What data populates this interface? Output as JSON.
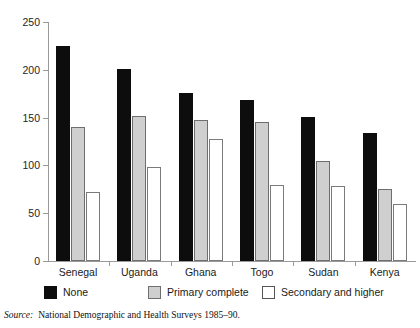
{
  "top_sliver_text": "",
  "chart_data": {
    "type": "bar",
    "title": "",
    "xlabel": "",
    "ylabel": "",
    "ylim": [
      0,
      250
    ],
    "yticks": [
      0,
      50,
      100,
      150,
      200,
      250
    ],
    "ytick_labels": [
      "0",
      "50",
      "100",
      "150",
      "200",
      "250"
    ],
    "grid": false,
    "legend_position": "bottom",
    "categories": [
      "Senegal",
      "Uganda",
      "Ghana",
      "Togo",
      "Sudan",
      "Kenya"
    ],
    "series": [
      {
        "name": "None",
        "color": "#0d0d0d",
        "values": [
          225,
          201,
          176,
          168,
          151,
          134
        ]
      },
      {
        "name": "Primary complete",
        "color": "#cfcfcf",
        "values": [
          140,
          152,
          148,
          145,
          105,
          75
        ]
      },
      {
        "name": "Secondary and higher",
        "color": "#ffffff",
        "values": [
          72,
          98,
          128,
          80,
          78,
          60
        ]
      }
    ]
  },
  "legend": {
    "items": [
      {
        "label": "None",
        "swatch": "black-square-swatch"
      },
      {
        "label": "Primary complete",
        "swatch": "gray-square-swatch"
      },
      {
        "label": "Secondary and higher",
        "swatch": "white-square-swatch"
      }
    ]
  },
  "source": {
    "label": "Source:",
    "text": "National Demographic and Health Surveys 1985–90."
  }
}
